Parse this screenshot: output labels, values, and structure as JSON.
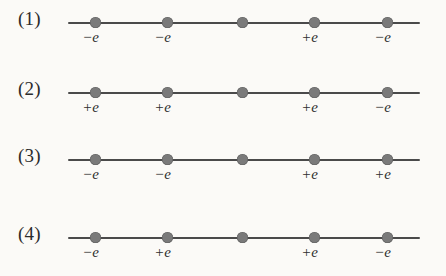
{
  "figure": {
    "background_color": "#fbfaf7",
    "line_color": "#4a4a4a",
    "dot_color": "#7a7a7a",
    "text_color": "#2e2e2e",
    "dot_positions_px": [
      95,
      167,
      242,
      314,
      387
    ],
    "line_start_px": 68,
    "line_end_px": 420,
    "rows": [
      {
        "label": "(1)",
        "charges": [
          {
            "sign": "−",
            "symbol": "e",
            "text": "−e"
          },
          {
            "sign": "−",
            "symbol": "e",
            "text": "−e"
          },
          {
            "sign": "",
            "symbol": "",
            "text": ""
          },
          {
            "sign": "+",
            "symbol": "e",
            "text": "+e"
          },
          {
            "sign": "−",
            "symbol": "e",
            "text": "−e"
          }
        ]
      },
      {
        "label": "(2)",
        "charges": [
          {
            "sign": "+",
            "symbol": "e",
            "text": "+e"
          },
          {
            "sign": "+",
            "symbol": "e",
            "text": "+e"
          },
          {
            "sign": "",
            "symbol": "",
            "text": ""
          },
          {
            "sign": "+",
            "symbol": "e",
            "text": "+e"
          },
          {
            "sign": "−",
            "symbol": "e",
            "text": "−e"
          }
        ]
      },
      {
        "label": "(3)",
        "charges": [
          {
            "sign": "−",
            "symbol": "e",
            "text": "−e"
          },
          {
            "sign": "−",
            "symbol": "e",
            "text": "−e"
          },
          {
            "sign": "",
            "symbol": "",
            "text": ""
          },
          {
            "sign": "+",
            "symbol": "e",
            "text": "+e"
          },
          {
            "sign": "+",
            "symbol": "e",
            "text": "+e"
          }
        ]
      },
      {
        "label": "(4)",
        "charges": [
          {
            "sign": "−",
            "symbol": "e",
            "text": "−e"
          },
          {
            "sign": "+",
            "symbol": "e",
            "text": "+e"
          },
          {
            "sign": "",
            "symbol": "",
            "text": ""
          },
          {
            "sign": "+",
            "symbol": "e",
            "text": "+e"
          },
          {
            "sign": "−",
            "symbol": "e",
            "text": "−e"
          }
        ]
      }
    ]
  }
}
